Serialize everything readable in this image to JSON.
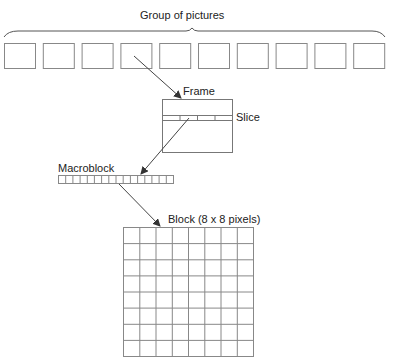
{
  "title": "Group of pictures",
  "labels": {
    "frame": "Frame",
    "slice": "Slice",
    "macroblock": "Macroblock",
    "block": "Block (8 x 8 pixels)"
  },
  "gop": {
    "frame_count": 10
  },
  "slice": {
    "segments": 4
  },
  "macroblock": {
    "cells": 16
  },
  "block": {
    "rows": 8,
    "cols": 8
  },
  "colors": {
    "stroke": "#777777",
    "text": "#222222",
    "arrow": "#444444"
  }
}
